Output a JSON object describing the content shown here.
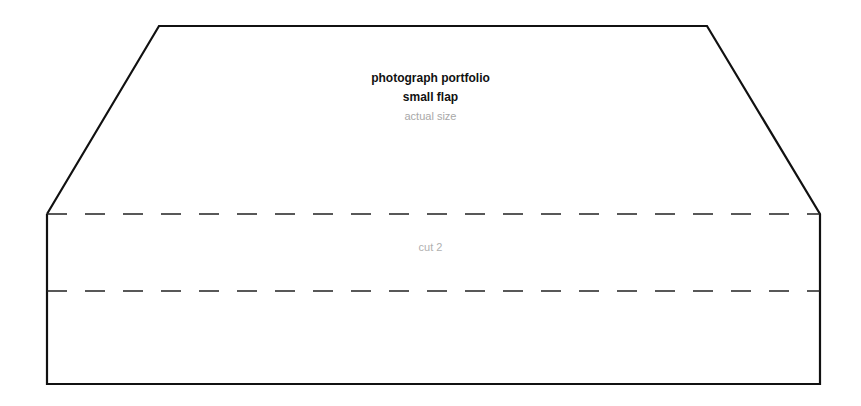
{
  "template": {
    "title": "photograph portfolio",
    "subtitle": "small flap",
    "scale_note": "actual size",
    "cut_instruction": "cut 2"
  },
  "colors": {
    "outline": "#111111",
    "title_text": "#111111",
    "muted_text": "#a8a8a8"
  }
}
